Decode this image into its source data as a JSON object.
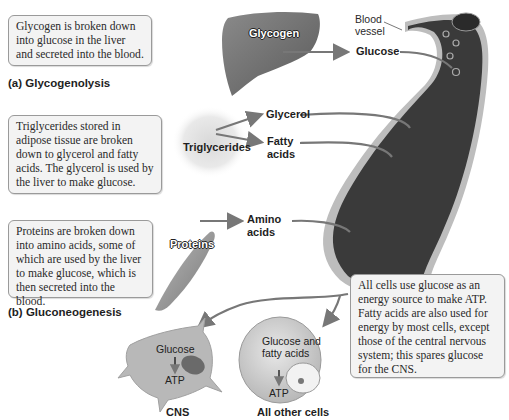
{
  "boxes": {
    "glycogenolysis": "Glycogen is broken down into glucose in the liver and secreted into the blood.",
    "triglycerides": "Triglycerides stored in adipose tissue are broken down to glycerol and fatty acids. The glycerol is used by the liver to make glucose.",
    "proteins": "Proteins are broken down into amino acids, some of which are used by the liver to make glucose, which is then secreted into the blood.",
    "all_cells": "All cells use glucose as an energy source to make ATP. Fatty acids are also used for energy by most cells, except those of the central nervous system; this spares glucose for the CNS."
  },
  "captions": {
    "a": "(a) Glycogenolysis",
    "b": "(b) Gluconeogenesis"
  },
  "labels": {
    "glycogen": "Glycogen",
    "glucose": "Glucose",
    "blood_vessel_line1": "Blood",
    "blood_vessel_line2": "vessel",
    "triglycerides": "Triglycerides",
    "glycerol": "Glycerol",
    "fatty_line1": "Fatty",
    "fatty_line2": "acids",
    "proteins": "Proteins",
    "amino_line1": "Amino",
    "amino_line2": "acids"
  },
  "cells": {
    "cns": {
      "label": "CNS",
      "input": "Glucose",
      "output": "ATP"
    },
    "other": {
      "label": "All other cells",
      "input_line1": "Glucose and",
      "input_line2": "fatty acids",
      "output": "ATP"
    }
  },
  "colors": {
    "vessel_dark": "#3a3a3a",
    "vessel_wall": "#bdbdbd",
    "arrow": "#777777",
    "box_bg": "#f3f3f3"
  }
}
